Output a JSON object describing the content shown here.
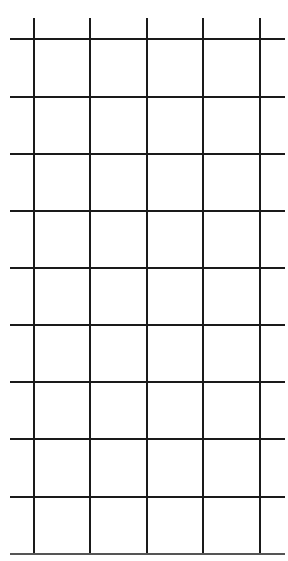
{
  "grid": {
    "background": "#ffffff",
    "line_color": "#1a1a1a",
    "columns": 5,
    "rows": 9,
    "vertical_lines_x": [
      33,
      89,
      146,
      202,
      259
    ],
    "vertical_top_y": 18,
    "vertical_bottom_y": 553,
    "horizontal_lines_y": [
      38,
      96,
      153,
      210,
      267,
      324,
      381,
      438,
      496,
      553
    ],
    "horizontal_left_x": 10,
    "horizontal_right_x": 285
  }
}
